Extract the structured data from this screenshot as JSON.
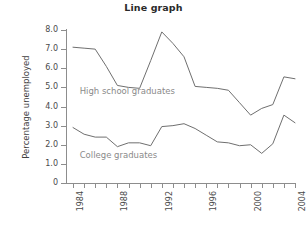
{
  "chart_data": {
    "type": "line",
    "title": "Line graph",
    "xlabel": "",
    "ylabel": "Percentage unemployed",
    "xlim": [
      1984,
      2004
    ],
    "ylim": [
      0,
      8
    ],
    "grid": false,
    "legend": "inline-labels",
    "x": [
      1984,
      1985,
      1986,
      1987,
      1988,
      1989,
      1990,
      1991,
      1992,
      1993,
      1994,
      1995,
      1996,
      1997,
      1998,
      1999,
      2000,
      2001,
      2002,
      2003,
      2004
    ],
    "ytick_labels": [
      "8.0",
      "7.0",
      "6.0",
      "5.0",
      "4.0",
      "3.0",
      "2.0",
      "1.0",
      "0"
    ],
    "ytick_values": [
      8.0,
      7.0,
      6.0,
      5.0,
      4.0,
      3.0,
      2.0,
      1.0,
      0
    ],
    "xtick_values": [
      1984,
      1985,
      1986,
      1987,
      1988,
      1989,
      1990,
      1991,
      1992,
      1993,
      1994,
      1995,
      1996,
      1997,
      1998,
      1999,
      2000,
      2001,
      2002,
      2003,
      2004
    ],
    "xtick_labels": [
      "1984",
      "",
      "",
      "",
      "1988",
      "",
      "",
      "",
      "1992",
      "",
      "",
      "",
      "1996",
      "",
      "",
      "",
      "2000",
      "",
      "",
      "",
      "2004"
    ],
    "series": [
      {
        "name": "High school graduates",
        "color": "#6f6f6f",
        "label_position": {
          "x": 1984.6,
          "y": 4.8
        },
        "values": [
          7.1,
          7.05,
          7.0,
          6.1,
          5.1,
          5.0,
          4.95,
          6.4,
          7.9,
          7.3,
          6.6,
          5.05,
          5.0,
          4.95,
          4.85,
          4.2,
          3.55,
          3.9,
          4.1,
          5.55,
          5.45
        ]
      },
      {
        "name": "College graduates",
        "color": "#6f6f6f",
        "label_position": {
          "x": 1984.6,
          "y": 1.45
        },
        "values": [
          2.9,
          2.55,
          2.4,
          2.4,
          1.9,
          2.1,
          2.1,
          1.95,
          2.95,
          3.0,
          3.1,
          2.85,
          2.5,
          2.15,
          2.1,
          1.95,
          2.0,
          1.55,
          2.05,
          3.55,
          3.15
        ]
      }
    ]
  },
  "figure": {
    "title": "Line graph",
    "y_axis_title": "Percentage unemployed",
    "series_labels": {
      "highschool": "High school graduates",
      "college": "College graduates"
    }
  }
}
